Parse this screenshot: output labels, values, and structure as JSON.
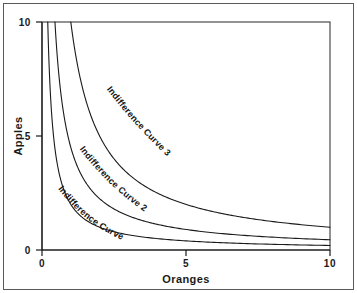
{
  "chart_data": {
    "type": "line",
    "title": "",
    "subtitle": "",
    "xlabel": "Oranges",
    "ylabel": "Apples",
    "xlim": [
      0,
      10
    ],
    "ylim": [
      0,
      10
    ],
    "xticks": [
      0,
      5,
      10
    ],
    "xticklabels": [
      "0",
      "5",
      "10"
    ],
    "yticks": [
      0,
      5,
      10
    ],
    "yticklabels": [
      "0",
      "5",
      "10"
    ],
    "grid": false,
    "legend_position": "inline-annotations",
    "annotations": [
      "Indifference Curve 1",
      "Indifference Curve 2",
      "Indifference Curve 3"
    ],
    "series": [
      {
        "name": "Indifference Curve 1",
        "form": "hyperbola",
        "constant": 2.0,
        "x": [
          0.2,
          0.4,
          0.6,
          0.8,
          1.0,
          1.5,
          2.0,
          2.5,
          3.0,
          4.0,
          5.0,
          6.0,
          7.0,
          8.0,
          9.0,
          10.0
        ],
        "y": [
          10.0,
          5.0,
          3.33,
          2.5,
          2.0,
          1.33,
          1.0,
          0.8,
          0.67,
          0.5,
          0.4,
          0.33,
          0.29,
          0.25,
          0.22,
          0.2
        ]
      },
      {
        "name": "Indifference Curve 2",
        "form": "hyperbola",
        "constant": 4.5,
        "x": [
          0.45,
          0.6,
          0.8,
          1.0,
          1.5,
          2.0,
          2.5,
          3.0,
          4.0,
          5.0,
          6.0,
          7.0,
          8.0,
          9.0,
          10.0
        ],
        "y": [
          10.0,
          7.5,
          5.63,
          4.5,
          3.0,
          2.25,
          1.8,
          1.5,
          1.13,
          0.9,
          0.75,
          0.64,
          0.56,
          0.5,
          0.45
        ]
      },
      {
        "name": "Indifference Curve 3",
        "form": "hyperbola",
        "constant": 10.0,
        "x": [
          1.0,
          1.5,
          2.0,
          2.5,
          3.0,
          3.5,
          4.0,
          5.0,
          6.0,
          7.0,
          8.0,
          9.0,
          10.0
        ],
        "y": [
          10.0,
          6.67,
          5.0,
          4.0,
          3.33,
          2.86,
          2.5,
          2.0,
          1.67,
          1.43,
          1.25,
          1.11,
          1.0
        ]
      }
    ]
  },
  "axes": {
    "x_title": "Oranges",
    "y_title": "Apples",
    "x_ticks": [
      {
        "label": "0"
      },
      {
        "label": "5"
      },
      {
        "label": "10"
      }
    ],
    "y_ticks": [
      {
        "label": "0"
      },
      {
        "label": "5"
      },
      {
        "label": "10"
      }
    ]
  },
  "curve_labels": {
    "curve1": "Indifference Curve 1",
    "curve2": "Indifference Curve 2",
    "curve3": "Indifference Curve 3"
  },
  "colors": {
    "curve_stroke": "#1a1a1a",
    "axis": "#1a1a1a",
    "frame": "#5a5a5a",
    "background": "#ffffff",
    "text": "#1a1a1a"
  }
}
